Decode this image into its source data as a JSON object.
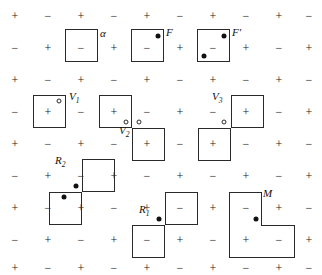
{
  "figure": {
    "width": 322,
    "height": 275,
    "background": "#ffffff",
    "line_color": "#2a2a2a",
    "dot_color": "#111111"
  },
  "grid": {
    "columns": 10,
    "rows": 9,
    "x_positions": [
      15,
      48,
      81,
      114,
      147,
      180,
      213,
      246,
      279,
      309
    ],
    "y_positions": [
      16,
      48,
      80,
      112,
      144,
      176,
      208,
      240,
      268
    ],
    "cell_size": 33,
    "sign_rule": "plus when (row+col) even, minus when odd",
    "plus": "+",
    "minus": "−",
    "signs": [
      [
        "+",
        "−",
        "+",
        "−",
        "+",
        "−",
        "+",
        "−",
        "+",
        "−"
      ],
      [
        "−",
        "+",
        "−",
        "+",
        "−",
        "+",
        "−",
        "+",
        "−",
        "+"
      ],
      [
        "+",
        "−",
        "+",
        "−",
        "+",
        "−",
        "+",
        "−",
        "+",
        "−"
      ],
      [
        "−",
        "+",
        "−",
        "+",
        "−",
        "+",
        "−",
        "+",
        "−",
        "+"
      ],
      [
        "+",
        "−",
        "+",
        "−",
        "+",
        "−",
        "+",
        "−",
        "+",
        "−"
      ],
      [
        "−",
        "+",
        "−",
        "+",
        "−",
        "+",
        "−",
        "+",
        "−",
        "+"
      ],
      [
        "+",
        "−",
        "+",
        "−",
        "+",
        "−",
        "+",
        "−",
        "+",
        "−"
      ],
      [
        "−",
        "+",
        "−",
        "+",
        "−",
        "+",
        "−",
        "+",
        "−",
        "+"
      ],
      [
        "+",
        "−",
        "+",
        "−",
        "+",
        "−",
        "+",
        "−",
        "+",
        "−"
      ]
    ]
  },
  "pieces": [
    {
      "id": "alpha",
      "label": "α",
      "label_style": "italic",
      "label_x": 100,
      "label_y": 27,
      "cells": [
        {
          "x": 65,
          "y": 29,
          "w": 33,
          "h": 33
        }
      ],
      "seams": [],
      "dots": [],
      "open_dots": []
    },
    {
      "id": "F",
      "label": "F",
      "label_style": "italic",
      "label_x": 166,
      "label_y": 26,
      "cells": [
        {
          "x": 131,
          "y": 29,
          "w": 33,
          "h": 33
        }
      ],
      "seams": [],
      "dots": [
        {
          "x": 158,
          "y": 36
        }
      ],
      "open_dots": []
    },
    {
      "id": "Fprime",
      "label": "F′",
      "label_style": "italic",
      "label_x": 232,
      "label_y": 26,
      "cells": [
        {
          "x": 197,
          "y": 29,
          "w": 33,
          "h": 33
        }
      ],
      "seams": [],
      "dots": [
        {
          "x": 224,
          "y": 36
        },
        {
          "x": 204,
          "y": 56
        }
      ],
      "open_dots": []
    },
    {
      "id": "V1",
      "label": "V",
      "sub": "1",
      "label_style": "italic",
      "label_x": 69,
      "label_y": 90,
      "cells": [
        {
          "x": 33,
          "y": 95,
          "w": 33,
          "h": 33
        }
      ],
      "seams": [],
      "dots": [],
      "open_dots": [
        {
          "x": 59,
          "y": 101
        }
      ]
    },
    {
      "id": "V2",
      "label": "V",
      "sub": "2",
      "label_style": "italic",
      "label_x": 119,
      "label_y": 124,
      "cells": [
        {
          "x": 99,
          "y": 95,
          "w": 33,
          "h": 33
        },
        {
          "x": 132,
          "y": 128,
          "w": 33,
          "h": 33
        }
      ],
      "seams": [],
      "dots": [],
      "open_dots": [
        {
          "x": 126,
          "y": 122
        },
        {
          "x": 139,
          "y": 122
        }
      ]
    },
    {
      "id": "V3",
      "label": "V",
      "sub": "3",
      "label_style": "italic",
      "label_x": 212,
      "label_y": 90,
      "cells": [
        {
          "x": 231,
          "y": 95,
          "w": 33,
          "h": 33
        },
        {
          "x": 198,
          "y": 128,
          "w": 33,
          "h": 33
        }
      ],
      "seams": [],
      "dots": [],
      "open_dots": [
        {
          "x": 224,
          "y": 122
        }
      ]
    },
    {
      "id": "R2",
      "label": "R",
      "sub": "2",
      "label_style": "italic",
      "label_x": 55,
      "label_y": 154,
      "cells": [
        {
          "x": 82,
          "y": 159,
          "w": 33,
          "h": 33
        },
        {
          "x": 49,
          "y": 192,
          "w": 33,
          "h": 33
        }
      ],
      "seams": [],
      "dots": [
        {
          "x": 76,
          "y": 186
        },
        {
          "x": 64,
          "y": 197
        }
      ],
      "open_dots": []
    },
    {
      "id": "R1",
      "label": "R",
      "sub": "1",
      "label_style": "italic",
      "label_x": 139,
      "label_y": 203,
      "cells": [
        {
          "x": 165,
          "y": 192,
          "w": 33,
          "h": 33
        },
        {
          "x": 132,
          "y": 225,
          "w": 33,
          "h": 33
        }
      ],
      "seams": [],
      "dots": [
        {
          "x": 159,
          "y": 219
        }
      ],
      "open_dots": []
    },
    {
      "id": "M",
      "label": "M",
      "label_style": "italic",
      "label_x": 263,
      "label_y": 187,
      "cells": [
        {
          "x": 229,
          "y": 192,
          "w": 33,
          "h": 33
        },
        {
          "x": 229,
          "y": 225,
          "w": 33,
          "h": 33
        },
        {
          "x": 262,
          "y": 225,
          "w": 33,
          "h": 33
        }
      ],
      "seams": [
        {
          "x": 230,
          "y": 224,
          "w": 31,
          "h": 3
        },
        {
          "x": 261,
          "y": 226,
          "w": 3,
          "h": 31
        }
      ],
      "dots": [
        {
          "x": 256,
          "y": 219
        }
      ],
      "open_dots": []
    }
  ]
}
